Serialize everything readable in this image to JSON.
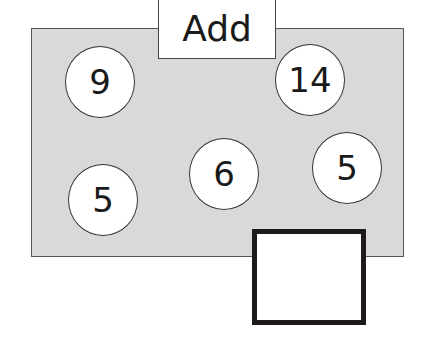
{
  "operation_label": "Add",
  "numbers": [
    {
      "value": "9",
      "cx": 100,
      "cy": 82
    },
    {
      "value": "14",
      "cx": 310,
      "cy": 80
    },
    {
      "value": "5",
      "cx": 103,
      "cy": 200
    },
    {
      "value": "6",
      "cx": 224,
      "cy": 174
    },
    {
      "value": "5",
      "cx": 347,
      "cy": 168
    }
  ],
  "answer": ""
}
